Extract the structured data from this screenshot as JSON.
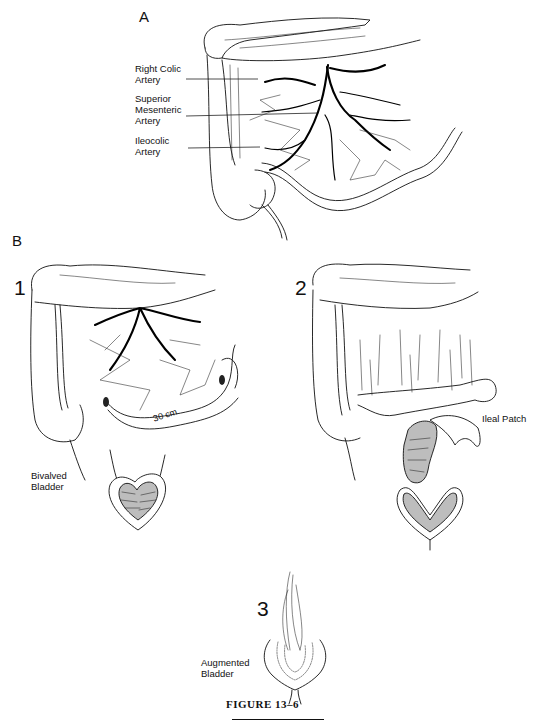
{
  "figure": {
    "caption": "FIGURE 13–6",
    "colors": {
      "ink": "#111111",
      "background": "#ffffff"
    }
  },
  "panel_a": {
    "letter": "A",
    "labels": [
      {
        "text": "Right Colic\nArtery"
      },
      {
        "text": "Superior\nMesenteric\nArtery"
      },
      {
        "text": "Ileocolic\nArtery"
      }
    ]
  },
  "panel_b": {
    "letter": "B",
    "steps": [
      {
        "number": "1",
        "measurement": "30 cm",
        "label": "Bivalved\nBladder"
      },
      {
        "number": "2",
        "label": "Ileal Patch"
      },
      {
        "number": "3",
        "label": "Augmented\nBladder"
      }
    ]
  }
}
